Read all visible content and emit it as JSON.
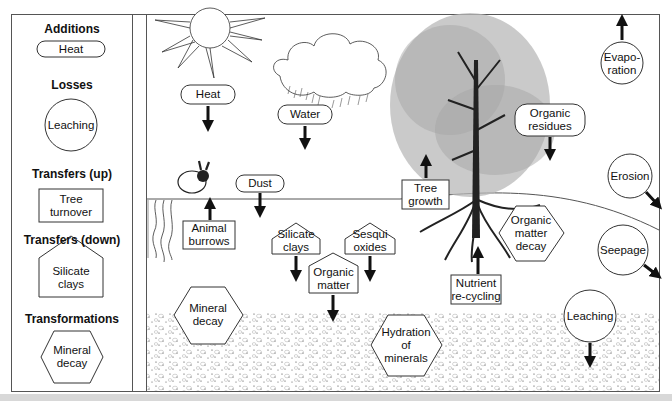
{
  "legend": {
    "items": [
      {
        "heading": "Additions",
        "shape": "pill",
        "label": "Heat"
      },
      {
        "heading": "Losses",
        "shape": "circle",
        "label": "Leaching"
      },
      {
        "heading": "Transfers (up)",
        "shape": "rectangle",
        "label": "Tree turnover"
      },
      {
        "heading": "Transfers (down)",
        "shape": "pentagon",
        "label": "Silicate clays"
      },
      {
        "heading": "Transformations",
        "shape": "hexagon",
        "label": "Mineral decay"
      }
    ]
  },
  "diagram": {
    "additions": [
      {
        "label": "Heat",
        "direction": "down"
      },
      {
        "label": "Water",
        "direction": "down"
      },
      {
        "label": "Dust",
        "direction": "down"
      },
      {
        "label": "Organic residues",
        "direction": "down"
      }
    ],
    "losses": [
      {
        "label": "Evapo-ration",
        "line1": "Evapo-",
        "line2": "ration",
        "direction": "up"
      },
      {
        "label": "Erosion",
        "direction": "down-right"
      },
      {
        "label": "Seepage",
        "direction": "down-right"
      },
      {
        "label": "Leaching",
        "direction": "down"
      }
    ],
    "transfers_up": [
      {
        "label": "Animal burrows",
        "line1": "Animal",
        "line2": "burrows"
      },
      {
        "label": "Tree growth",
        "line1": "Tree",
        "line2": "growth"
      },
      {
        "label": "Nutrient re-cycling",
        "line1": "Nutrient",
        "line2": "re-cycling"
      }
    ],
    "transfers_down": [
      {
        "label": "Silicate clays",
        "line1": "Silicate",
        "line2": "clays"
      },
      {
        "label": "Sesqui oxides",
        "line1": "Sesqui",
        "line2": "oxides"
      },
      {
        "label": "Organic matter",
        "line1": "Organic",
        "line2": "matter"
      }
    ],
    "transformations": [
      {
        "label": "Mineral decay",
        "line1": "Mineral",
        "line2": "decay"
      },
      {
        "label": "Organic matter decay",
        "line1": "Organic",
        "line2": "matter",
        "line3": "decay"
      },
      {
        "label": "Hydration of minerals",
        "line1": "Hydration",
        "line2": "of",
        "line3": "minerals"
      }
    ],
    "illustrations": [
      "sun",
      "rain-cloud",
      "tree",
      "rabbit",
      "earthworm-burrows",
      "soil-gravel-layer"
    ]
  },
  "colors": {
    "line": "#111111",
    "frame": "#555555",
    "foliage": "#9a9a9a",
    "strip": "#d8d8d8"
  }
}
